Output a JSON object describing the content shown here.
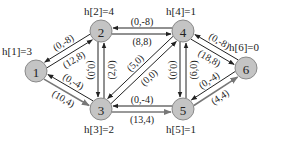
{
  "diagram": {
    "nodes": [
      {
        "id": "1",
        "label": "1",
        "h_label": "h[1]=3",
        "x": 36,
        "y": 71
      },
      {
        "id": "2",
        "label": "2",
        "h_label": "h[2]=4",
        "x": 101,
        "y": 31
      },
      {
        "id": "3",
        "label": "3",
        "h_label": "h[3]=2",
        "x": 101,
        "y": 109
      },
      {
        "id": "4",
        "label": "4",
        "h_label": "h[4]=1",
        "x": 183,
        "y": 31
      },
      {
        "id": "5",
        "label": "5",
        "h_label": "h[5]=1",
        "x": 183,
        "y": 109
      },
      {
        "id": "6",
        "label": "6",
        "h_label": "h[6]=0",
        "x": 246,
        "y": 68
      }
    ],
    "edges": [
      {
        "from": "1",
        "to": "2",
        "label": "(12,8)",
        "style": "black"
      },
      {
        "from": "2",
        "to": "1",
        "label": "(0,-8)",
        "style": "black"
      },
      {
        "from": "1",
        "to": "3",
        "label": "(10,4)",
        "style": "gray"
      },
      {
        "from": "3",
        "to": "1",
        "label": "(0,-4)",
        "style": "black"
      },
      {
        "from": "2",
        "to": "4",
        "label": "(8,8)",
        "style": "black"
      },
      {
        "from": "4",
        "to": "2",
        "label": "(0,-8)",
        "style": "black"
      },
      {
        "from": "3",
        "to": "2",
        "label": "(2,0)",
        "style": "black"
      },
      {
        "from": "2",
        "to": "3",
        "label": "(0,0)",
        "style": "black"
      },
      {
        "from": "4",
        "to": "3",
        "label": "(5,0)",
        "style": "black"
      },
      {
        "from": "3",
        "to": "4",
        "label": "(0,0)",
        "style": "black"
      },
      {
        "from": "3",
        "to": "5",
        "label": "(13,4)",
        "style": "gray"
      },
      {
        "from": "5",
        "to": "3",
        "label": "(0,-4)",
        "style": "black"
      },
      {
        "from": "5",
        "to": "4",
        "label": "(6,0)",
        "style": "black"
      },
      {
        "from": "4",
        "to": "5",
        "label": "(0,0)",
        "style": "black"
      },
      {
        "from": "4",
        "to": "6",
        "label": "(18,8)",
        "style": "black"
      },
      {
        "from": "6",
        "to": "4",
        "label": "(0,-8)",
        "style": "black"
      },
      {
        "from": "5",
        "to": "6",
        "label": "(4,4)",
        "style": "gray"
      },
      {
        "from": "6",
        "to": "5",
        "label": "(0,-4)",
        "style": "black"
      }
    ]
  }
}
